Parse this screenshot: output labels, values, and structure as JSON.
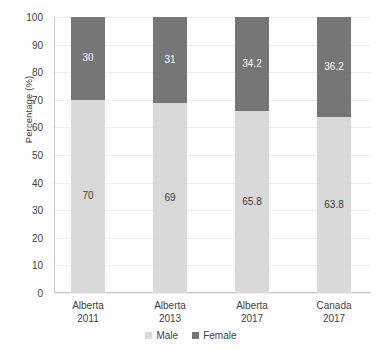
{
  "chart_data": {
    "type": "bar",
    "stacked": true,
    "title": "",
    "xlabel": "",
    "ylabel": "Percentage (%)",
    "ylim": [
      0,
      100
    ],
    "ytick_step": 10,
    "yticks": [
      100,
      90,
      80,
      70,
      60,
      50,
      40,
      30,
      20,
      10,
      0
    ],
    "grid": true,
    "grid_axis": "y",
    "legend_position": "bottom",
    "categories": [
      {
        "line1": "Alberta",
        "line2": "2011"
      },
      {
        "line1": "Alberta",
        "line2": "2013"
      },
      {
        "line1": "Alberta",
        "line2": "2017"
      },
      {
        "line1": "Canada",
        "line2": "2017"
      }
    ],
    "category_labels": [
      "Alberta 2011",
      "Alberta 2013",
      "Alberta 2017",
      "Canada 2017"
    ],
    "series": [
      {
        "name": "Male",
        "color": "#d9d9d9",
        "values": [
          70,
          69,
          65.8,
          63.8
        ],
        "labels": [
          "70",
          "69",
          "65.8",
          "63.8"
        ]
      },
      {
        "name": "Female",
        "color": "#767676",
        "values": [
          30,
          31,
          34.2,
          36.2
        ],
        "labels": [
          "30",
          "31",
          "34.2",
          "36.2"
        ]
      }
    ]
  },
  "colors": {
    "male": "#d9d9d9",
    "female": "#767676",
    "gridline": "#ededed",
    "axis": "#c9c9c9",
    "text": "#3f3f3f"
  }
}
